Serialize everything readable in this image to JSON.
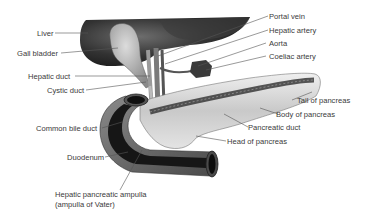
{
  "diagram": {
    "labels": {
      "liver": "Liver",
      "gall_bladder": "Gall bladder",
      "hepatic_duct": "Hepatic duct",
      "cystic_duct": "Cystic duct",
      "common_bile_duct": "Common bile duct",
      "duodenum": "Duodenum",
      "ampulla_line1": "Hepatic pancreatic ampulla",
      "ampulla_line2": "(ampulla of Vater)",
      "portal_vein": "Portal vein",
      "hepatic_artery": "Hepatic artery",
      "aorta": "Aorta",
      "coeliac_artery": "Coeliac artery",
      "tail_of_pancreas": "Tail of pancreas",
      "body_of_pancreas": "Body of pancreas",
      "pancreatic_duct": "Pancreatic duct",
      "head_of_pancreas": "Head of pancreas"
    },
    "colors": {
      "background": "#ffffff",
      "label_text": "#3a3a3a",
      "leader_line": "#555555",
      "liver": "#2b2b2b",
      "gall_bladder": "#b8b8b8",
      "pancreas": "#d8d8d8",
      "duodenum_outer": "#6a6a6a",
      "duodenum_lumen": "#1a1a1a"
    }
  }
}
